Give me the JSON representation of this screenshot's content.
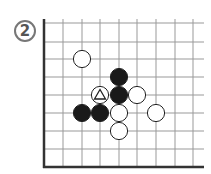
{
  "diagram": {
    "label": "2",
    "grid": {
      "x_lines": [
        44,
        63,
        82,
        100,
        119,
        137,
        156,
        175,
        193
      ],
      "y_lines": [
        23,
        42,
        59,
        77,
        95,
        113,
        131,
        149,
        167
      ],
      "top_edge": 19,
      "right_edge": 204,
      "line_color": "#999999",
      "border_color": "#333333"
    },
    "stones": [
      {
        "col": 2,
        "row": 2,
        "color": "white",
        "mark": ""
      },
      {
        "col": 4,
        "row": 3,
        "color": "black",
        "mark": ""
      },
      {
        "col": 3,
        "row": 4,
        "color": "white",
        "mark": "triangle"
      },
      {
        "col": 4,
        "row": 4,
        "color": "black",
        "mark": ""
      },
      {
        "col": 5,
        "row": 4,
        "color": "white",
        "mark": ""
      },
      {
        "col": 2,
        "row": 5,
        "color": "black",
        "mark": ""
      },
      {
        "col": 3,
        "row": 5,
        "color": "black",
        "mark": ""
      },
      {
        "col": 4,
        "row": 5,
        "color": "white",
        "mark": ""
      },
      {
        "col": 6,
        "row": 5,
        "color": "white",
        "mark": ""
      },
      {
        "col": 4,
        "row": 6,
        "color": "white",
        "mark": ""
      }
    ]
  }
}
